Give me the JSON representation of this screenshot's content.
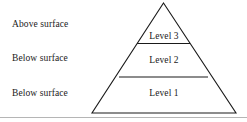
{
  "diagram": {
    "type": "pyramid",
    "title": "",
    "background_color": "#ffffff",
    "stroke_color": "#1a1a1a",
    "text_color": "#1a1a1a",
    "baseline_color": "#b5b5b5",
    "side_labels": [
      {
        "text": "Above surface"
      },
      {
        "text": "Below surface"
      },
      {
        "text": "Below surface"
      }
    ],
    "tiers": [
      {
        "label": "Level 3",
        "position": "top"
      },
      {
        "label": "Level 2",
        "position": "middle"
      },
      {
        "label": "Level 1",
        "position": "bottom"
      }
    ]
  }
}
